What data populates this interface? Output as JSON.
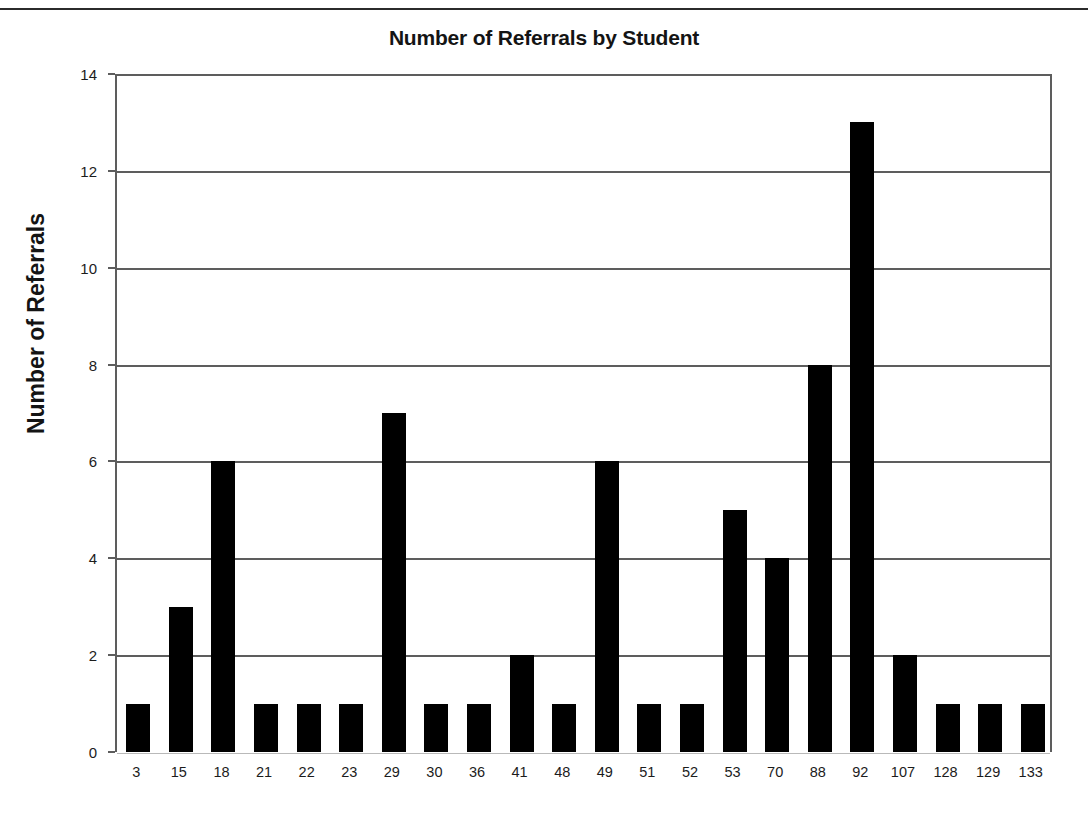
{
  "chart_data": {
    "type": "bar",
    "title": "Number of Referrals by Student",
    "xlabel": "",
    "ylabel": "Number of Referrals",
    "categories": [
      "3",
      "15",
      "18",
      "21",
      "22",
      "23",
      "29",
      "30",
      "36",
      "41",
      "48",
      "49",
      "51",
      "52",
      "53",
      "70",
      "88",
      "92",
      "107",
      "128",
      "129",
      "133"
    ],
    "values": [
      1,
      3,
      6,
      1,
      1,
      1,
      7,
      1,
      1,
      2,
      1,
      6,
      1,
      1,
      5,
      4,
      8,
      13,
      2,
      1,
      1,
      1
    ],
    "ylim": [
      0,
      14
    ],
    "y_ticks": [
      0,
      2,
      4,
      6,
      8,
      10,
      12,
      14
    ],
    "y_tick_labels": [
      "0",
      "2",
      "4",
      "6",
      "8",
      "10",
      "12",
      "14"
    ],
    "grid": true,
    "grid_axis": "y",
    "legend": false,
    "bar_color": "#000000",
    "axis_color": "#5d5d5d",
    "background": "#ffffff"
  },
  "page": {
    "divider": "top-rule"
  }
}
